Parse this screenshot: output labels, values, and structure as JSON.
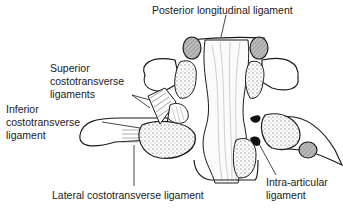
{
  "diagram": {
    "labels": {
      "posterior_longitudinal": "Posterior longitudinal ligament",
      "superior_costotransverse_1": "Superior",
      "superior_costotransverse_2": "costotransverse",
      "superior_costotransverse_3": "ligaments",
      "inferior_costotransverse_1": "Inferior",
      "inferior_costotransverse_2": "costotransverse",
      "inferior_costotransverse_3": "ligament",
      "lateral_costotransverse": "Lateral costotransverse ligament",
      "intra_articular_1": "Intra-articular",
      "intra_articular_2": "ligament"
    },
    "colors": {
      "line": "#1a1a1a",
      "shaded": "#9a9a9a",
      "background": "#ffffff"
    }
  }
}
